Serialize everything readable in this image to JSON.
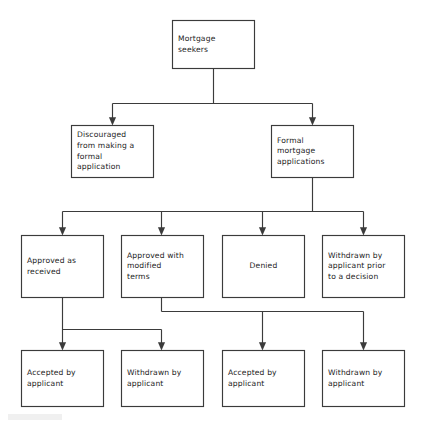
{
  "diagram": {
    "type": "flowchart",
    "orientation": "top-down",
    "canvas": {
      "width": 422,
      "height": 424
    },
    "colors": {
      "background": "#ffffff",
      "box_stroke": "#3b3b3b",
      "box_fill": "#ffffff",
      "connector": "#3b3b3b",
      "text": "#1c1c1c"
    },
    "levels": [
      {
        "level": 1,
        "nodes": [
          {
            "id": "mortgage-seekers",
            "text": "Mortgage\nseekers",
            "align": "left"
          }
        ]
      },
      {
        "level": 2,
        "nodes": [
          {
            "id": "discouraged",
            "text": "Discouraged\nfrom making a\nformal\napplication",
            "align": "left"
          },
          {
            "id": "formal-applications",
            "text": "Formal\nmortgage\napplications",
            "align": "left"
          }
        ]
      },
      {
        "level": 3,
        "nodes": [
          {
            "id": "approved-as-received",
            "text": "Approved as\nreceived",
            "align": "left"
          },
          {
            "id": "approved-modified",
            "text": "Approved with\nmodified\nterms",
            "align": "left"
          },
          {
            "id": "denied",
            "text": "Denied",
            "align": "center"
          },
          {
            "id": "withdrawn-prior",
            "text": "Withdrawn by\napplicant prior\nto a decision",
            "align": "left"
          }
        ]
      },
      {
        "level": 4,
        "nodes": [
          {
            "id": "accepted-1",
            "text": "Accepted by\napplicant",
            "align": "left"
          },
          {
            "id": "withdrawn-1",
            "text": "Withdrawn by\napplicant",
            "align": "left"
          },
          {
            "id": "accepted-2",
            "text": "Accepted by\napplicant",
            "align": "left"
          },
          {
            "id": "withdrawn-2",
            "text": "Withdrawn by\napplicant",
            "align": "left"
          }
        ]
      }
    ],
    "edges": [
      {
        "from": "mortgage-seekers",
        "to": "discouraged"
      },
      {
        "from": "mortgage-seekers",
        "to": "formal-applications"
      },
      {
        "from": "formal-applications",
        "to": "approved-as-received"
      },
      {
        "from": "formal-applications",
        "to": "approved-modified"
      },
      {
        "from": "formal-applications",
        "to": "denied"
      },
      {
        "from": "formal-applications",
        "to": "withdrawn-prior"
      },
      {
        "from": "approved-as-received",
        "to": "accepted-1"
      },
      {
        "from": "approved-as-received",
        "to": "withdrawn-1"
      },
      {
        "from": "approved-modified",
        "to": "accepted-2"
      },
      {
        "from": "approved-modified",
        "to": "withdrawn-2"
      }
    ]
  }
}
